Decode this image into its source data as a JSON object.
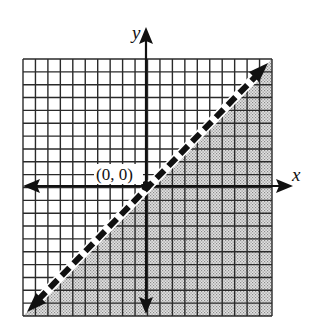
{
  "chart_data": {
    "type": "inequality-graph",
    "title": "",
    "xlabel": "x",
    "ylabel": "y",
    "grid": true,
    "grid_cells": {
      "columns": 20,
      "rows": 20
    },
    "xlim": [
      -10,
      10
    ],
    "ylim": [
      -10,
      10
    ],
    "boundary_line": {
      "equation": "y = x",
      "style": "dashed",
      "arrows": "both-ends",
      "from": [
        -10,
        -10
      ],
      "to": [
        10,
        10
      ]
    },
    "shaded_region": "below-right of line (y < x)",
    "annotations": [
      {
        "text": "(0, 0)",
        "x": 0,
        "y": 0,
        "marker": "filled-dot"
      }
    ]
  },
  "labels": {
    "x_axis": "x",
    "y_axis": "y",
    "origin": "(0, 0)"
  },
  "colors": {
    "grid_line": "#2a2a2a",
    "shade": "#c9c9c9",
    "boundary": "#111111",
    "axis": "#111111",
    "background": "#ffffff"
  }
}
